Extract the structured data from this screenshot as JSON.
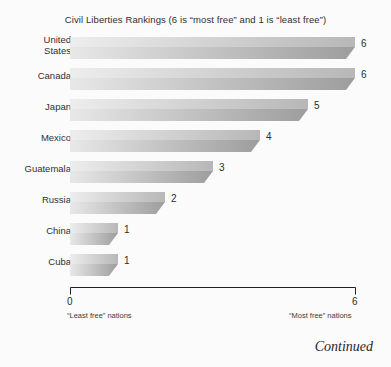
{
  "chart_data": {
    "type": "bar",
    "orientation": "horizontal",
    "title": "Civil Liberties Rankings (6 is “most free” and 1 is “least free”)",
    "categories": [
      "United\nStates",
      "Canada",
      "Japan",
      "Mexico",
      "Guatemala",
      "Russia",
      "China",
      "Cuba"
    ],
    "values": [
      6,
      6,
      5,
      4,
      3,
      2,
      1,
      1
    ],
    "value_labels": [
      "6",
      "6",
      "5",
      "4",
      "3",
      "2",
      "1",
      "1"
    ],
    "xlabel": "",
    "ylabel": "",
    "xlim": [
      0,
      6
    ],
    "xticks": [
      0,
      6
    ],
    "xtick_labels": [
      "0",
      "6"
    ],
    "grid": false,
    "legend": false,
    "annotations": {
      "axis_min_note": "“Least free” nations",
      "axis_max_note": "“Most free” nations"
    }
  },
  "figure": {
    "continued_note": "Continued",
    "colors": {
      "background": "#fbfbfb",
      "bar_light": "#e8e8e8",
      "bar_dark": "#9d9d9d",
      "axis_line": "#1f1f1f",
      "text": "#2b2b2b"
    }
  }
}
